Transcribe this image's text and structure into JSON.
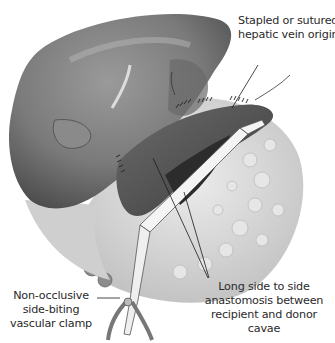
{
  "figure": {
    "type": "surgical illustration",
    "colors": {
      "liver": "#7d7d7d",
      "liver_dark": "#555555",
      "tissue": "#d9d9d9",
      "clamp": "#f2f2f2",
      "leader": "#1a1a1a",
      "text": "#2a2a2a"
    }
  },
  "annotations": [
    {
      "id": "hepatic-vein-origins",
      "lines": [
        "Stapled or sutured",
        "hepatic vein origins"
      ]
    },
    {
      "id": "side-to-side-anastomosis",
      "lines": [
        "Long side to side",
        "anastomosis between",
        "recipient and donor",
        "cavae"
      ]
    },
    {
      "id": "vascular-clamp",
      "lines": [
        "Non-occlusive",
        "side-biting",
        "vascular clamp"
      ]
    }
  ]
}
